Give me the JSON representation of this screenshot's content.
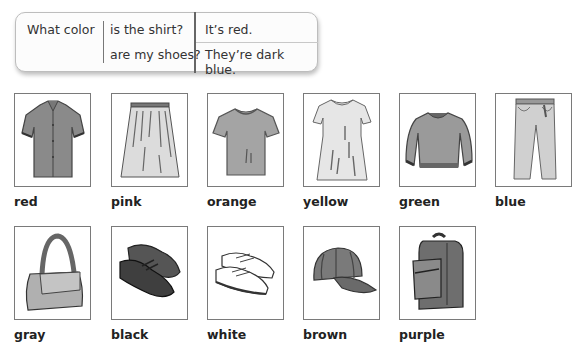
{
  "grammar": {
    "question_start": "What color",
    "question_endings": [
      "is the shirt?",
      "are my shoes?"
    ],
    "answers": [
      "It’s red.",
      "They’re dark blue."
    ]
  },
  "vocabulary": {
    "row1": [
      {
        "item": "shirt",
        "color": "red",
        "icon": "shirt-icon"
      },
      {
        "item": "skirt",
        "color": "pink",
        "icon": "skirt-icon"
      },
      {
        "item": "t-shirt",
        "color": "orange",
        "icon": "tshirt-icon"
      },
      {
        "item": "dress",
        "color": "yellow",
        "icon": "dress-icon"
      },
      {
        "item": "sweater",
        "color": "green",
        "icon": "sweater-icon"
      },
      {
        "item": "jeans",
        "color": "blue",
        "icon": "jeans-icon"
      }
    ],
    "row2": [
      {
        "item": "handbag",
        "color": "gray",
        "icon": "handbag-icon"
      },
      {
        "item": "shoes",
        "color": "black",
        "icon": "shoes-icon"
      },
      {
        "item": "sneakers",
        "color": "white",
        "icon": "sneakers-icon"
      },
      {
        "item": "cap",
        "color": "brown",
        "icon": "cap-icon"
      },
      {
        "item": "backpack",
        "color": "purple",
        "icon": "backpack-icon"
      }
    ]
  }
}
